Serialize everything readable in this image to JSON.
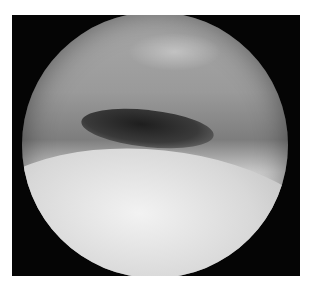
{
  "image": {
    "description": "Grayscale endoscopic view inside a circular field on a black frame, showing a tissue fold with a dark cavity above a brightly lit lower surface",
    "colors": {
      "frame": "#050505",
      "background": "#ffffff",
      "tissue_light": "#e6e6e6",
      "tissue_mid": "#9a9a9a",
      "cavity_dark": "#1e1e1e"
    }
  }
}
